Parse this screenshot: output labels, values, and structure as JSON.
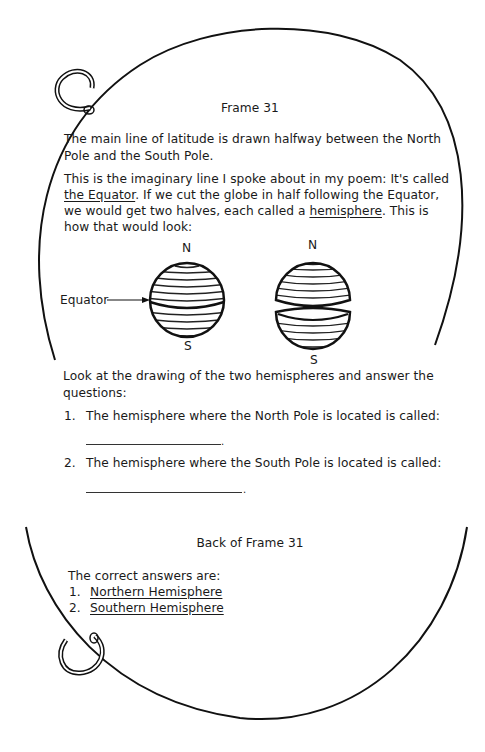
{
  "front": {
    "title": "Frame 31",
    "para1_line1": "The main line of latitude is drawn halfway between the North",
    "para1_line2": "Pole and the South Pole.",
    "para2_line1": "This is the imaginary line I spoke about in my poem: It's called",
    "para2_line2_u": "the Equator",
    "para2_line2_rest": ". If we cut the globe in half following the Equator,",
    "para2_line3_a": "we would get two halves, each called a ",
    "para2_line3_u": "hemisphere",
    "para2_line3_b": ". This is",
    "para2_line4": "how that would look:",
    "figure": {
      "north_label": "N",
      "south_label": "S",
      "equator_label": "Equator"
    },
    "instruction_line1": "Look at the drawing of the two hemispheres and answer the",
    "instruction_line2": "questions:",
    "questions": [
      {
        "number": "1.",
        "text": "The hemisphere where the North Pole is located is called:",
        "answer_value": ""
      },
      {
        "number": "2.",
        "text": "The hemisphere where the South Pole is located is called:",
        "answer_value": ""
      }
    ]
  },
  "back": {
    "title": "Back of Frame 31",
    "intro": "The correct answers are:",
    "answers": [
      {
        "number": "1.",
        "text": "Northern Hemisphere"
      },
      {
        "number": "2.",
        "text": "Southern Hemisphere"
      }
    ]
  }
}
